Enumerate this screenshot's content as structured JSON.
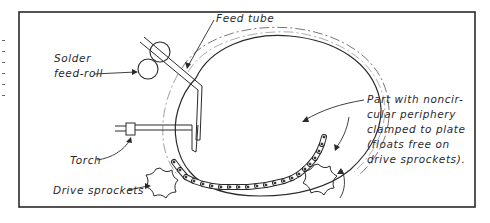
{
  "figure": {
    "labels": {
      "feed_tube": "Feed tube",
      "solder_feed_roll_line1": "Solder",
      "solder_feed_roll_line2": "feed-roll",
      "torch": "Torch",
      "drive_sprockets": "Drive sprockets",
      "part_line1": "Part with noncir-",
      "part_line2": "cular periphery",
      "part_line3": "clamped to plate",
      "part_line4": "(floats free on",
      "part_line5": "drive sprockets)."
    },
    "colors": {
      "ink": "#2a2a2a",
      "background": "#ffffff"
    }
  }
}
